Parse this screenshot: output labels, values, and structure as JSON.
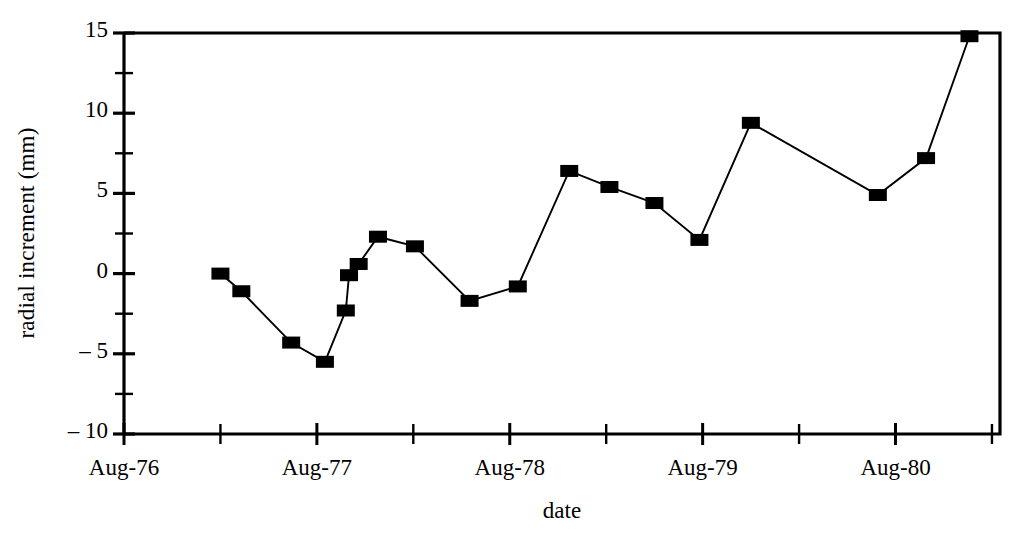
{
  "chart_data": {
    "type": "line",
    "title": "",
    "xlabel": "date",
    "ylabel": "radial increment (mm)",
    "ylim": [
      -10,
      15
    ],
    "ytick_major": [
      15,
      10,
      5,
      0,
      -5,
      -10
    ],
    "ytick_major_labels": [
      "15",
      "10",
      "5",
      "0",
      "– 5",
      "– 10"
    ],
    "ytick_minor": [
      12.5,
      7.5,
      2.5,
      -2.5,
      -7.5
    ],
    "xlim_months_from_aug76": [
      0,
      54.5
    ],
    "xtick_major_labels": [
      "Aug-76",
      "Aug-77",
      "Aug-78",
      "Aug-79",
      "Aug-80"
    ],
    "xtick_major_months": [
      0,
      12,
      24,
      36,
      48
    ],
    "xtick_minor_months": [
      6,
      18,
      30,
      42,
      54
    ],
    "grid": false,
    "legend": null,
    "marker": "filled-square",
    "marker_color": "#000000",
    "line_color": "#000000",
    "x_units": "months after Aug-76",
    "points": [
      {
        "x": 6.0,
        "y": 0.0
      },
      {
        "x": 7.3,
        "y": -1.1
      },
      {
        "x": 10.4,
        "y": -4.3
      },
      {
        "x": 12.5,
        "y": -5.5
      },
      {
        "x": 13.8,
        "y": -2.3
      },
      {
        "x": 14.0,
        "y": -0.1
      },
      {
        "x": 14.6,
        "y": 0.6
      },
      {
        "x": 15.8,
        "y": 2.3
      },
      {
        "x": 18.1,
        "y": 1.7
      },
      {
        "x": 21.5,
        "y": -1.7
      },
      {
        "x": 24.5,
        "y": -0.8
      },
      {
        "x": 27.7,
        "y": 6.4
      },
      {
        "x": 30.2,
        "y": 5.4
      },
      {
        "x": 33.0,
        "y": 4.4
      },
      {
        "x": 35.8,
        "y": 2.1
      },
      {
        "x": 39.0,
        "y": 9.4
      },
      {
        "x": 46.9,
        "y": 4.9
      },
      {
        "x": 49.9,
        "y": 7.2
      },
      {
        "x": 52.6,
        "y": 14.8
      }
    ]
  }
}
